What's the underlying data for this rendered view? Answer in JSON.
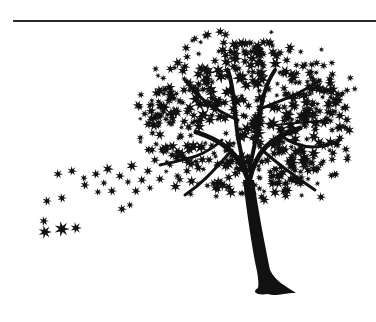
{
  "illustration": {
    "subject": "tree silhouette with leaves blowing in the wind",
    "colors": {
      "background": "#ffffff",
      "ink": "#111111",
      "rule": "#2a2a2a"
    },
    "rule": {
      "x1": 13,
      "x2": 376,
      "y": 21
    },
    "trunk": {
      "base_x": 265,
      "base_y": 295
    },
    "canopy": {
      "cx": 248,
      "cy": 118,
      "rx": 100,
      "ry": 78
    },
    "scattered_leaves": [
      [
        45,
        232,
        7
      ],
      [
        62,
        229,
        8
      ],
      [
        76,
        228,
        6
      ],
      [
        44,
        221,
        5
      ],
      [
        47,
        201,
        5
      ],
      [
        62,
        198,
        5
      ],
      [
        85,
        185,
        5
      ],
      [
        98,
        192,
        4
      ],
      [
        104,
        183,
        4
      ],
      [
        112,
        191,
        5
      ],
      [
        96,
        174,
        5
      ],
      [
        108,
        169,
        6
      ],
      [
        120,
        176,
        5
      ],
      [
        122,
        209,
        5
      ],
      [
        128,
        182,
        4
      ],
      [
        130,
        205,
        4
      ],
      [
        58,
        174,
        5
      ],
      [
        72,
        171,
        5
      ],
      [
        84,
        178,
        4
      ],
      [
        136,
        191,
        5
      ],
      [
        142,
        180,
        5
      ],
      [
        148,
        171,
        5
      ],
      [
        150,
        188,
        4
      ],
      [
        155,
        160,
        5
      ],
      [
        160,
        179,
        5
      ],
      [
        164,
        150,
        5
      ],
      [
        170,
        165,
        4
      ],
      [
        333,
        153,
        5
      ],
      [
        321,
        197,
        5
      ],
      [
        340,
        138,
        5
      ],
      [
        326,
        120,
        5
      ],
      [
        313,
        103,
        5
      ],
      [
        132,
        166,
        6
      ]
    ]
  }
}
